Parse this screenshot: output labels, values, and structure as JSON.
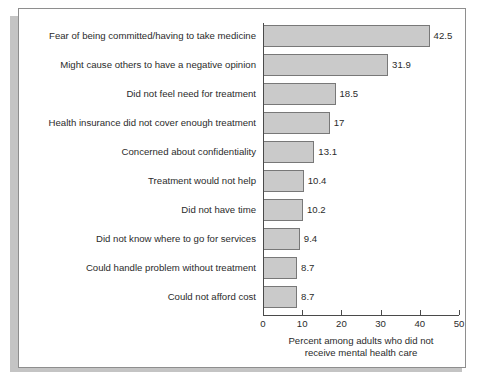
{
  "chart_data": {
    "type": "bar",
    "orientation": "horizontal",
    "title": "",
    "subtitle": "",
    "xlabel_line1": "Percent among adults who did not",
    "xlabel_line2": "receive mental health care",
    "ylabel": "",
    "xlim": [
      0,
      50
    ],
    "xticks": [
      0,
      10,
      20,
      30,
      40,
      50
    ],
    "xtick_labels": [
      "0",
      "10",
      "20",
      "30",
      "40",
      "50"
    ],
    "grid": false,
    "legend": false,
    "bar_fill_color": "#cacaca",
    "bar_border_color": "#787878",
    "categories": [
      "Fear of being committed/having to take medicine",
      "Might cause others to have a negative opinion",
      "Did not feel need for treatment",
      "Health insurance did not cover enough treatment",
      "Concerned about confidentiality",
      "Treatment would not help",
      "Did not have time",
      "Did not know where to go for services",
      "Could handle problem without treatment",
      "Could not afford cost"
    ],
    "values": [
      42.5,
      31.9,
      18.5,
      17,
      13.1,
      10.4,
      10.2,
      9.4,
      8.7,
      8.7
    ],
    "value_labels": [
      "42.5",
      "31.9",
      "18.5",
      "17",
      "13.1",
      "10.4",
      "10.2",
      "9.4",
      "8.7",
      "8.7"
    ]
  }
}
